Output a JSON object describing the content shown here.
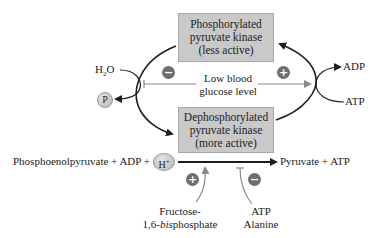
{
  "boxes": {
    "top": {
      "line1": "Phosphorylated",
      "line2": "pyruvate kinase",
      "line3": "(less active)"
    },
    "bottom": {
      "line1": "Dephosphorylated",
      "line2": "pyruvate kinase",
      "line3": "(more active)"
    }
  },
  "left_cycle": {
    "input_main": "H",
    "input_sub": "2",
    "input_tail": "O",
    "output_circle": "P"
  },
  "right_cycle": {
    "output": "ADP",
    "input": "ATP"
  },
  "regulator": {
    "line1": "Low blood",
    "line2": "glucose level",
    "left_sign": "−",
    "right_sign": "+"
  },
  "reaction": {
    "substrates": "Phosphoenolpyruvate + ADP +",
    "proton_main": "H",
    "proton_sup": "+",
    "products": "Pyruvate + ATP"
  },
  "activator": {
    "sign": "+",
    "line1": "Fructose-",
    "line2_prefix": "1,6-",
    "line2_italic": "bis",
    "line2_suffix": "phosphate"
  },
  "inhibitor": {
    "sign": "−",
    "line1": "ATP",
    "line2": "Alanine"
  },
  "colors": {
    "box_fill": "#c9c9c9",
    "sign_fill": "#6e6e6e",
    "arrow_dark": "#1e1e1e",
    "arrow_gray": "#8a8a8a"
  }
}
